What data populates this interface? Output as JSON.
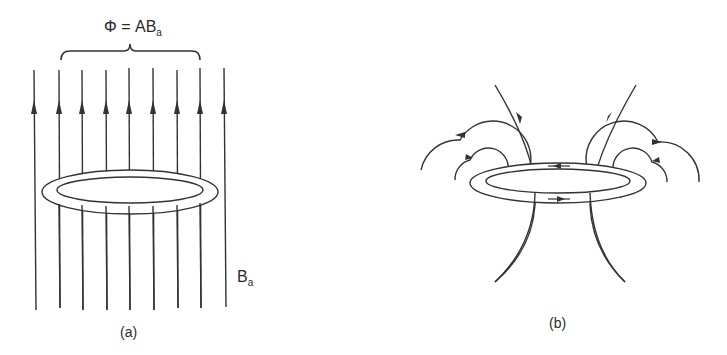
{
  "panel_a": {
    "flux_label": "Φ = AB",
    "flux_subscript": "a",
    "field_label": "B",
    "field_subscript": "a",
    "caption": "(a)",
    "field_line_count": 9
  },
  "panel_b": {
    "caption": "(b)"
  }
}
